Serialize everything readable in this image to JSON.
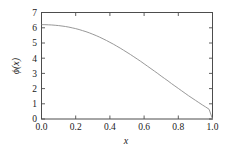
{
  "chart_data": {
    "type": "line",
    "title": "",
    "subtitle": "",
    "xlabel": "x",
    "ylabel": "ϕ(x)",
    "xlim": [
      0.0,
      1.0
    ],
    "ylim": [
      0.0,
      7.0
    ],
    "grid": false,
    "legend": null,
    "legend_position": "none",
    "xticks": [
      0.0,
      0.2,
      0.4,
      0.6,
      0.8,
      1.0
    ],
    "xtick_labels": [
      "0.0",
      "0.2",
      "0.4",
      "0.6",
      "0.8",
      "1.0"
    ],
    "yticks": [
      0,
      1,
      2,
      3,
      4,
      5,
      6,
      7
    ],
    "ytick_labels": [
      "0",
      "1",
      "2",
      "3",
      "4",
      "5",
      "6",
      "7"
    ],
    "tick_direction": "in",
    "spines": [
      "left",
      "right",
      "top",
      "bottom"
    ],
    "series": [
      {
        "name": "phi",
        "color": "#8c8c8c",
        "x": [
          0.0,
          0.02,
          0.04,
          0.06,
          0.08,
          0.1,
          0.12,
          0.14,
          0.16,
          0.18,
          0.2,
          0.22,
          0.24,
          0.26,
          0.28,
          0.3,
          0.32,
          0.34,
          0.36,
          0.38,
          0.4,
          0.42,
          0.44,
          0.46,
          0.48,
          0.5,
          0.52,
          0.54,
          0.56,
          0.58,
          0.6,
          0.62,
          0.64,
          0.66,
          0.68,
          0.7,
          0.72,
          0.74,
          0.76,
          0.78,
          0.8,
          0.82,
          0.84,
          0.86,
          0.88,
          0.9,
          0.92,
          0.94,
          0.96,
          0.98,
          1.0
        ],
        "values": [
          6.2,
          6.2,
          6.19,
          6.18,
          6.16,
          6.14,
          6.11,
          6.08,
          6.04,
          5.99,
          5.94,
          5.88,
          5.81,
          5.74,
          5.66,
          5.57,
          5.48,
          5.38,
          5.27,
          5.16,
          5.04,
          4.92,
          4.79,
          4.66,
          4.52,
          4.38,
          4.24,
          4.09,
          3.94,
          3.79,
          3.63,
          3.47,
          3.31,
          3.15,
          2.99,
          2.82,
          2.66,
          2.5,
          2.33,
          2.17,
          2.01,
          1.85,
          1.69,
          1.53,
          1.38,
          1.23,
          1.08,
          0.93,
          0.79,
          0.64,
          0.0
        ]
      }
    ],
    "annotations": []
  },
  "axes": {
    "xlabel": "x",
    "ylabel": "ϕ(x)"
  }
}
